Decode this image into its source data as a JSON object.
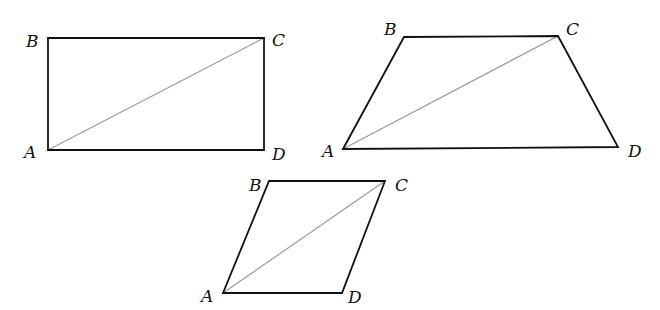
{
  "figures": [
    {
      "name": "rectangle",
      "vertices": {
        "A": [
          48,
          150
        ],
        "B": [
          48,
          38
        ],
        "C": [
          264,
          38
        ],
        "D": [
          264,
          150
        ]
      },
      "labels": {
        "A": "A",
        "B": "B",
        "C": "C",
        "D": "D"
      },
      "label_pos": {
        "A": [
          24,
          158
        ],
        "B": [
          26,
          47
        ],
        "C": [
          272,
          46
        ],
        "D": [
          272,
          160
        ]
      },
      "diagonal": [
        "A",
        "C"
      ]
    },
    {
      "name": "trapezoid",
      "vertices": {
        "A": [
          343,
          149
        ],
        "B": [
          404,
          37
        ],
        "C": [
          558,
          36
        ],
        "D": [
          618,
          147
        ]
      },
      "labels": {
        "A": "A",
        "B": "B",
        "C": "C",
        "D": "D"
      },
      "label_pos": {
        "A": [
          322,
          157
        ],
        "B": [
          384,
          35
        ],
        "C": [
          566,
          35
        ],
        "D": [
          628,
          157
        ]
      },
      "diagonal": [
        "A",
        "C"
      ]
    },
    {
      "name": "rhombus",
      "vertices": {
        "A": [
          223,
          293
        ],
        "B": [
          269,
          181
        ],
        "C": [
          385,
          181
        ],
        "D": [
          342,
          293
        ]
      },
      "labels": {
        "A": "A",
        "B": "B",
        "C": "C",
        "D": "D"
      },
      "label_pos": {
        "A": [
          201,
          302
        ],
        "B": [
          249,
          191
        ],
        "C": [
          395,
          191
        ],
        "D": [
          348,
          303
        ]
      },
      "diagonal": [
        "A",
        "C"
      ]
    }
  ]
}
